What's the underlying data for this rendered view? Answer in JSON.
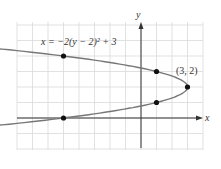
{
  "chart_data": {
    "type": "line",
    "title": "",
    "equation_label": "x = −2(y − 2)² + 3",
    "xlabel": "x",
    "ylabel": "y",
    "xlim": [
      -8,
      4
    ],
    "ylim": [
      -2,
      6
    ],
    "grid": true,
    "series": [
      {
        "name": "x = −2(y − 2)² + 3",
        "points": [
          {
            "x": -5,
            "y": 4
          },
          {
            "x": 1,
            "y": 3
          },
          {
            "x": 3,
            "y": 2
          },
          {
            "x": 1,
            "y": 1
          },
          {
            "x": -5,
            "y": 0
          }
        ]
      }
    ],
    "annotations": [
      {
        "text": "(3, 2)",
        "x": 3,
        "y": 2
      }
    ]
  },
  "labels": {
    "equation": "x = −2(y − 2)² + 3",
    "x_axis": "x",
    "y_axis": "y",
    "vertex": "(3, 2)"
  },
  "colors": {
    "grid": "#d9d9d9",
    "axis": "#333333",
    "curve": "#777777",
    "point": "#111111"
  }
}
